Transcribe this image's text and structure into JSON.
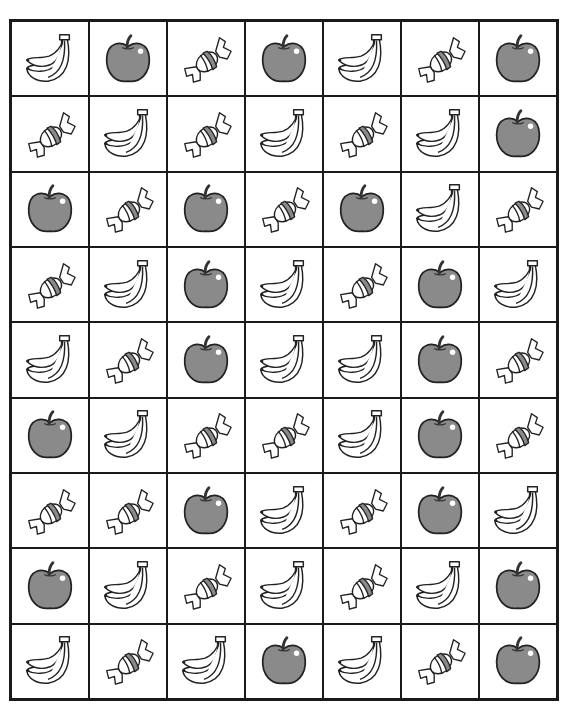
{
  "worksheet": {
    "rows": 9,
    "columns": 7,
    "colors": {
      "apple_fill": "#8a8a8a",
      "stroke": "#222222",
      "candy_stripe": "#8a8a8a",
      "highlight": "#ffffff",
      "grid_line": "#1a1a1a"
    },
    "grid": [
      [
        "banana",
        "apple",
        "candy",
        "apple",
        "banana",
        "candy",
        "apple"
      ],
      [
        "candy",
        "banana",
        "candy",
        "banana",
        "candy",
        "banana",
        "apple"
      ],
      [
        "apple",
        "candy",
        "apple",
        "candy",
        "apple",
        "banana",
        "candy"
      ],
      [
        "candy",
        "banana",
        "apple",
        "banana",
        "candy",
        "apple",
        "banana"
      ],
      [
        "banana",
        "candy",
        "apple",
        "banana",
        "banana",
        "apple",
        "candy"
      ],
      [
        "apple",
        "banana",
        "candy",
        "candy",
        "banana",
        "apple",
        "candy"
      ],
      [
        "candy",
        "candy",
        "apple",
        "banana",
        "candy",
        "apple",
        "banana"
      ],
      [
        "apple",
        "banana",
        "candy",
        "banana",
        "candy",
        "banana",
        "apple"
      ],
      [
        "banana",
        "candy",
        "banana",
        "apple",
        "banana",
        "candy",
        "apple"
      ]
    ]
  }
}
